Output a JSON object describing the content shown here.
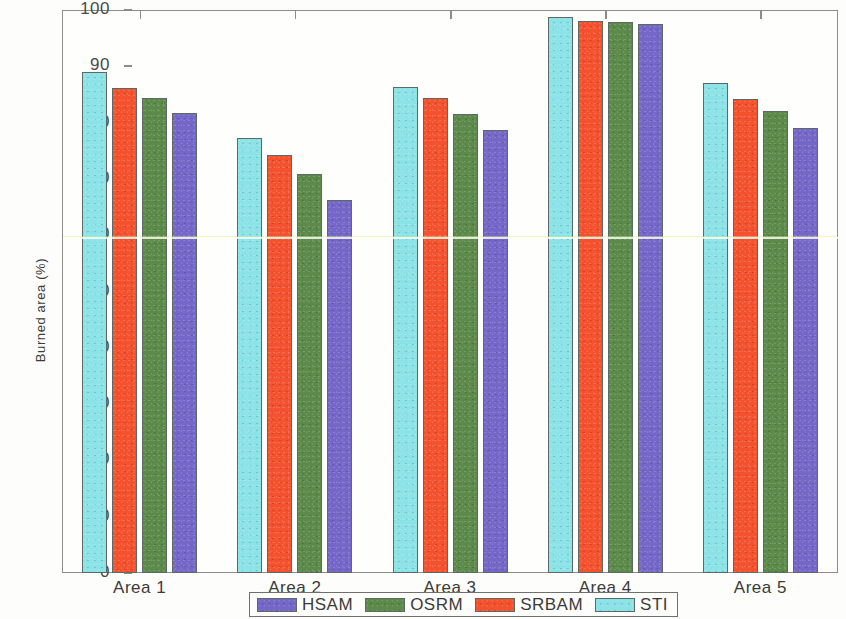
{
  "chart_data": {
    "type": "bar",
    "title": "",
    "xlabel": "",
    "ylabel": "Burned area (%)",
    "ylim": [
      0,
      100
    ],
    "yticks": [
      0,
      10,
      20,
      30,
      40,
      50,
      60,
      70,
      80,
      90,
      100
    ],
    "grid": false,
    "legend_position": "bottom-outside",
    "categories": [
      "Area 1",
      "Area 2",
      "Area 3",
      "Area 4",
      "Area 5"
    ],
    "series": [
      {
        "name": "STI",
        "color": "#8BE3E8",
        "values": [
          89.0,
          77.2,
          86.3,
          98.7,
          87.0
        ]
      },
      {
        "name": "SRBAM",
        "color": "#F4522E",
        "values": [
          86.2,
          74.2,
          84.3,
          98.1,
          84.2
        ]
      },
      {
        "name": "OSRM",
        "color": "#5B8A4A",
        "values": [
          84.3,
          70.8,
          81.6,
          97.8,
          82.0
        ]
      },
      {
        "name": "HSAM",
        "color": "#7567C8",
        "values": [
          81.7,
          66.3,
          78.6,
          97.5,
          79.0
        ]
      }
    ],
    "legend_order": [
      "HSAM",
      "OSRM",
      "SRBAM",
      "STI"
    ],
    "bar_draw_order": [
      "STI",
      "SRBAM",
      "OSRM",
      "HSAM"
    ]
  },
  "axis": {
    "y_tick_labels": [
      "0",
      "10",
      "20",
      "30",
      "40",
      "50",
      "60",
      "70",
      "80",
      "90",
      "100"
    ],
    "y_axis_title": "Burned area (%)",
    "x_tick_labels": [
      "Area 1",
      "Area 2",
      "Area 3",
      "Area 4",
      "Area 5"
    ]
  },
  "legend": {
    "entries": [
      {
        "label": "HSAM",
        "color": "#7567C8"
      },
      {
        "label": "OSRM",
        "color": "#5B8A4A"
      },
      {
        "label": "SRBAM",
        "color": "#F4522E"
      },
      {
        "label": "STI",
        "color": "#8BE3E8"
      }
    ]
  },
  "colors": {
    "sti": "#8BE3E8",
    "srbam": "#F4522E",
    "osrm": "#5B8A4A",
    "hsam": "#7567C8",
    "axis": "#8c8c88",
    "text": "#3b3b39",
    "background": "#fdfdfb"
  }
}
